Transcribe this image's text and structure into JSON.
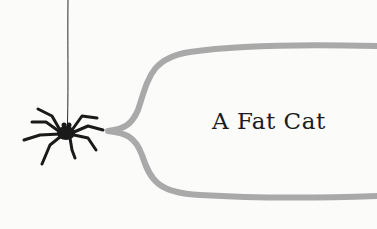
{
  "page": {
    "title": "A Fat Cat",
    "colors": {
      "background": "#fbfbfa",
      "bubble_outline": "#a9a9a9",
      "spider": "#1a1a1a",
      "text": "#1c1c1c"
    }
  },
  "illustration": {
    "spider": "spider-icon",
    "thread": "thread",
    "bubble": "speech-bubble"
  }
}
